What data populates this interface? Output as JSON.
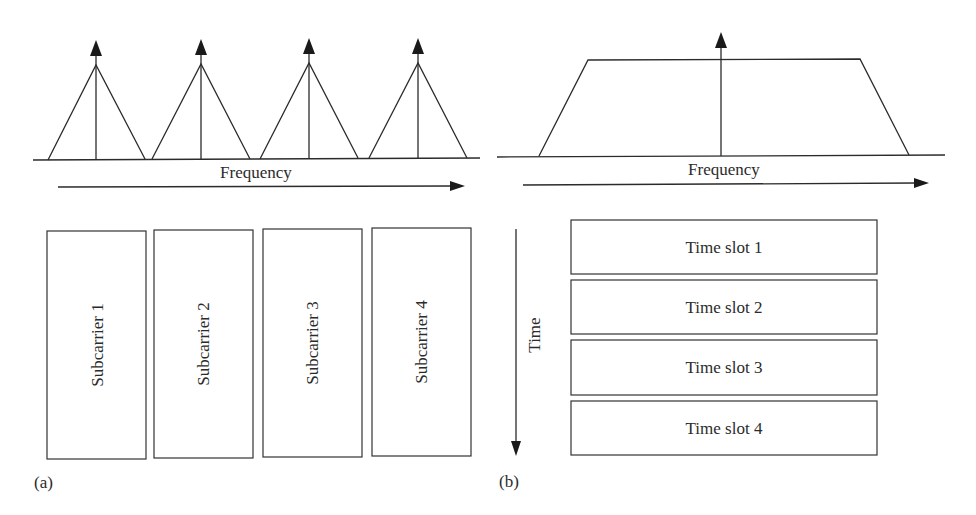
{
  "figure": {
    "panel_a": {
      "label": "(a)",
      "spectrum": {
        "axis_label": "Frequency",
        "peaks": [
          {
            "left": 48,
            "apex": 96,
            "right": 145,
            "apex_y": 65
          },
          {
            "left": 152,
            "apex": 201,
            "right": 250,
            "apex_y": 64
          },
          {
            "left": 260,
            "apex": 309,
            "right": 358,
            "apex_y": 63
          },
          {
            "left": 369,
            "apex": 418,
            "right": 467,
            "apex_y": 63
          }
        ]
      },
      "subcarriers": [
        {
          "label": "Subcarrier 1"
        },
        {
          "label": "Subcarrier 2"
        },
        {
          "label": "Subcarrier 3"
        },
        {
          "label": "Subcarrier 4"
        }
      ]
    },
    "panel_b": {
      "label": "(b)",
      "spectrum": {
        "axis_label": "Frequency",
        "shape": "trapezoid"
      },
      "time_axis_label": "Time",
      "time_slots": [
        {
          "label": "Time slot 1"
        },
        {
          "label": "Time slot 2"
        },
        {
          "label": "Time slot 3"
        },
        {
          "label": "Time slot 4"
        }
      ]
    },
    "colors": {
      "line": "#2b2b2b",
      "background": "#ffffff"
    }
  }
}
